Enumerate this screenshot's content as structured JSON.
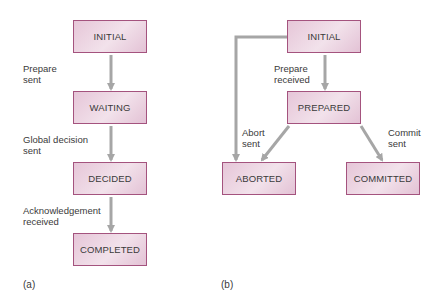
{
  "diagram_a": {
    "caption": "(a)",
    "states": [
      "INITIAL",
      "WAITING",
      "DECIDED",
      "COMPLETED"
    ],
    "transitions": [
      {
        "from": "INITIAL",
        "to": "WAITING",
        "label": "Prepare\nsent"
      },
      {
        "from": "WAITING",
        "to": "DECIDED",
        "label": "Global decision\nsent"
      },
      {
        "from": "DECIDED",
        "to": "COMPLETED",
        "label": "Acknowledgement\nreceived"
      }
    ]
  },
  "diagram_b": {
    "caption": "(b)",
    "states": [
      "INITIAL",
      "PREPARED",
      "ABORTED",
      "COMMITTED"
    ],
    "transitions": [
      {
        "from": "INITIAL",
        "to": "PREPARED",
        "label": "Prepare\nreceived"
      },
      {
        "from": "INITIAL",
        "to": "ABORTED",
        "label": ""
      },
      {
        "from": "PREPARED",
        "to": "ABORTED",
        "label": "Abort\nsent"
      },
      {
        "from": "PREPARED",
        "to": "COMMITTED",
        "label": "Commit\nsent"
      }
    ]
  },
  "colors": {
    "box_border": "#a4537e",
    "box_fill": "#ecd4e1",
    "arrow": "#a6a6a6",
    "text": "#3a3a3a"
  }
}
